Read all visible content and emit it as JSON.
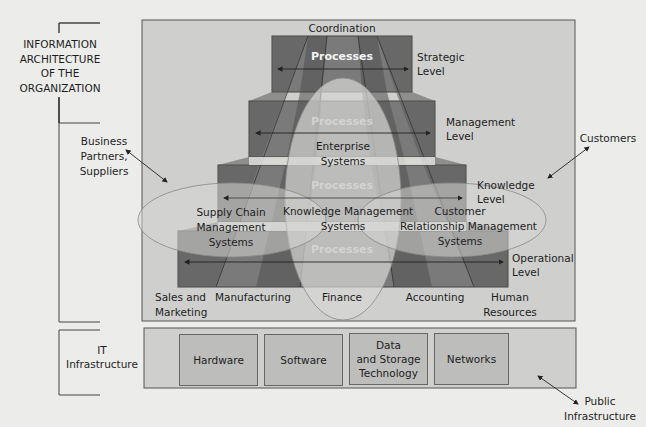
{
  "side_labels": {
    "info_architecture": [
      "INFORMATION",
      "ARCHITECTURE",
      "OF THE",
      "ORGANIZATION"
    ],
    "it_infrastructure": [
      "IT",
      "Infrastructure"
    ]
  },
  "external": {
    "business_partners": [
      "Business",
      "Partners,",
      "Suppliers"
    ],
    "customers": "Customers",
    "public_infrastructure": [
      "Public",
      "Infrastructure"
    ]
  },
  "pyramid": {
    "top_label": "Coordination",
    "process_label": "Processes",
    "levels": [
      {
        "name": "strategic",
        "label": [
          "Strategic",
          "Level"
        ]
      },
      {
        "name": "management",
        "label": [
          "Management",
          "Level"
        ]
      },
      {
        "name": "knowledge",
        "label": [
          "Knowledge",
          "Level"
        ]
      },
      {
        "name": "operational",
        "label": [
          "Operational",
          "Level"
        ]
      }
    ]
  },
  "systems": {
    "enterprise": [
      "Enterprise",
      "Systems"
    ],
    "supply_chain": [
      "Supply Chain",
      "Management",
      "Systems"
    ],
    "knowledge_mgmt": [
      "Knowledge Management",
      "Systems"
    ],
    "crm": [
      "Customer",
      "Relationship Management",
      "Systems"
    ]
  },
  "functional_areas": [
    [
      "Sales and",
      "Marketing"
    ],
    [
      "Manufacturing"
    ],
    [
      "Finance"
    ],
    [
      "Accounting"
    ],
    [
      "Human",
      "Resources"
    ]
  ],
  "infrastructure_components": [
    [
      "Hardware"
    ],
    [
      "Software"
    ],
    [
      "Data",
      "and Storage",
      "Technology"
    ],
    [
      "Networks"
    ]
  ],
  "colors": {
    "page_bg": "#ececea",
    "panel_bg": "#cfcfcd",
    "tier_dark": "#6a6a6a",
    "tier_mid": "#8a8a8a",
    "ellipse_fill": "#d4d4d2",
    "infra_box": "#bdbdbb"
  }
}
